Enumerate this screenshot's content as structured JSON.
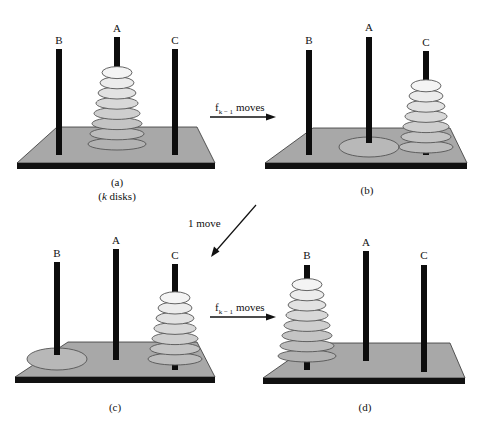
{
  "figure": {
    "colors": {
      "platform_top": "#a8a8a8",
      "platform_edge": "#111111",
      "peg": "#0d0d0d",
      "disk_outline": "#555555",
      "disk_shades": [
        "#f4f4f4",
        "#ececec",
        "#e2e2e2",
        "#d8d8d8",
        "#cecece",
        "#c4c4c4",
        "#bcbcbc",
        "#b2b2b2"
      ],
      "empty_spot": "#b8b8b8"
    },
    "disk_count": 8,
    "panels": [
      {
        "id": "a",
        "caption": "(a)",
        "subcaption_prefix": "(",
        "subcaption_var": "k",
        "subcaption_suffix": " disks)",
        "pegs": [
          {
            "label": "B",
            "disks": 0
          },
          {
            "label": "A",
            "disks": 8
          },
          {
            "label": "C",
            "disks": 0
          }
        ],
        "largest_disk_position": "A"
      },
      {
        "id": "b",
        "caption": "(b)",
        "pegs": [
          {
            "label": "B",
            "disks": 0
          },
          {
            "label": "A",
            "disks": 1
          },
          {
            "label": "C",
            "disks": 7
          }
        ],
        "largest_disk_position": "A"
      },
      {
        "id": "c",
        "caption": "(c)",
        "pegs": [
          {
            "label": "B",
            "disks": 1
          },
          {
            "label": "A",
            "disks": 0
          },
          {
            "label": "C",
            "disks": 7
          }
        ],
        "largest_disk_position": "B"
      },
      {
        "id": "d",
        "caption": "(d)",
        "pegs": [
          {
            "label": "B",
            "disks": 8
          },
          {
            "label": "A",
            "disks": 0
          },
          {
            "label": "C",
            "disks": 0
          }
        ],
        "largest_disk_position": "B"
      }
    ],
    "arrows": [
      {
        "from": "a",
        "to": "b",
        "label_var": "f",
        "label_sub": "k − 1",
        "label_text": " moves"
      },
      {
        "from": "b",
        "to": "c",
        "label_text": "1 move"
      },
      {
        "from": "c",
        "to": "d",
        "label_var": "f",
        "label_sub": "k − 1",
        "label_text": " moves"
      }
    ]
  }
}
